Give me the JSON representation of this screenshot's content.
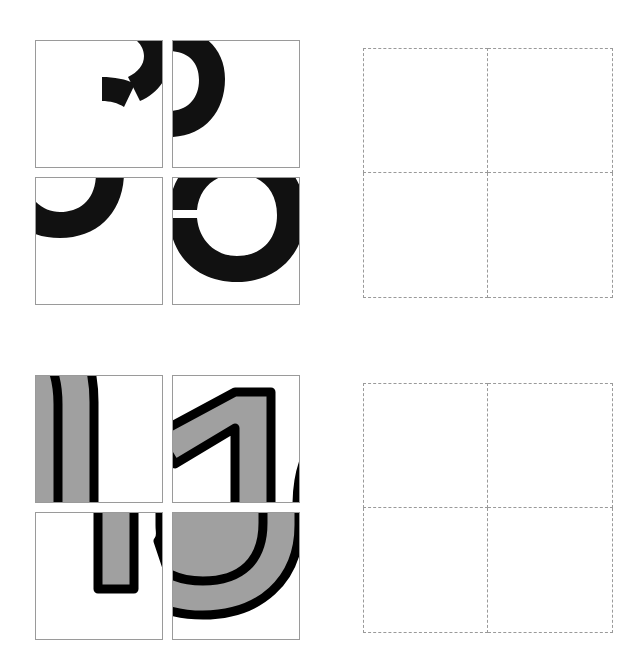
{
  "page": {
    "background_color": "#ffffff",
    "width": 639,
    "height": 668
  },
  "colors": {
    "tile_border": "#9a9a9a",
    "dashed_border": "#9a9a9a",
    "glyph_black": "#111111",
    "glyph_gray_fill": "#a0a0a0",
    "glyph_outline": "#000000",
    "tile_background": "#ffffff"
  },
  "puzzles": [
    {
      "id": "puzzle-1",
      "source": {
        "name": "tile-group-top",
        "glyph": "3",
        "style": "solid-black",
        "rows": 2,
        "columns": 2,
        "tile_size": 128,
        "gap": 9,
        "tiles": [
          {
            "index": 0,
            "position": "row-0-col-0",
            "fragment_label": "fragment-top-right-of-3",
            "description": "upper-right arc segments of the digit entering from the top edge"
          },
          {
            "index": 1,
            "position": "row-0-col-1",
            "fragment_label": "fragment-upper-left-bowl-of-3",
            "description": "thick upper-left curve hooking down from the left edge"
          },
          {
            "index": 2,
            "position": "row-1-col-0",
            "fragment_label": "fragment-left-lobe-of-3",
            "description": "left lobe arc crossing the upper-left corner"
          },
          {
            "index": 3,
            "position": "row-1-col-1",
            "fragment_label": "fragment-lower-right-bowl-of-3",
            "description": "lower-right rounded bowl entering from the right edge"
          }
        ]
      },
      "target": {
        "name": "drop-grid-top",
        "rows": 2,
        "columns": 2,
        "state": "empty",
        "border_style": "dashed",
        "cells": [
          {
            "index": 0,
            "position": "row-0-col-0",
            "content": ""
          },
          {
            "index": 1,
            "position": "row-0-col-1",
            "content": ""
          },
          {
            "index": 2,
            "position": "row-1-col-0",
            "content": ""
          },
          {
            "index": 3,
            "position": "row-1-col-1",
            "content": ""
          }
        ]
      }
    },
    {
      "id": "puzzle-2",
      "source": {
        "name": "tile-group-bottom",
        "glyph": "10",
        "style": "gray-fill-black-outline",
        "rows": 2,
        "columns": 2,
        "tile_size": 128,
        "gap": 9,
        "tiles": [
          {
            "index": 0,
            "position": "row-0-col-0",
            "fragment_label": "fragment-top-arch-of-0",
            "description": "rounded upper arch of the zero, gray fill with black outline"
          },
          {
            "index": 1,
            "position": "row-0-col-1",
            "fragment_label": "fragment-top-of-1",
            "description": "flag and upper stem of the one, plus a sliver of the zero at the right edge"
          },
          {
            "index": 2,
            "position": "row-1-col-0",
            "fragment_label": "fragment-bottom-stem-of-1",
            "description": "lower stem of the one with a thin arc sliver at the right edge"
          },
          {
            "index": 3,
            "position": "row-1-col-1",
            "fragment_label": "fragment-bottom-bowl-of-0",
            "description": "rounded lower bowl of the zero, gray fill with black outline"
          }
        ]
      },
      "target": {
        "name": "drop-grid-bottom",
        "rows": 2,
        "columns": 2,
        "state": "empty",
        "border_style": "dashed",
        "cells": [
          {
            "index": 0,
            "position": "row-0-col-0",
            "content": ""
          },
          {
            "index": 1,
            "position": "row-0-col-1",
            "content": ""
          },
          {
            "index": 2,
            "position": "row-1-col-0",
            "content": ""
          },
          {
            "index": 3,
            "position": "row-1-col-1",
            "content": ""
          }
        ]
      }
    }
  ]
}
